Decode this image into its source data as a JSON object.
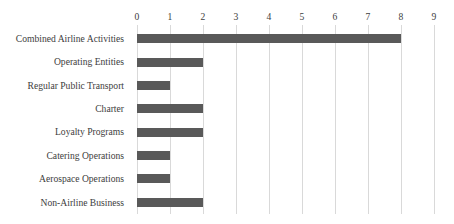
{
  "chart_data": {
    "type": "bar",
    "orientation": "horizontal",
    "title": "",
    "subtitle": "",
    "xlabel": "",
    "ylabel": "",
    "categories": [
      "Combined Airline Activities",
      "Operating Entities",
      "Regular Public Transport",
      "Charter",
      "Loyalty Programs",
      "Catering Operations",
      "Aerospace Operations",
      "Non-Airline Business"
    ],
    "values": [
      8,
      2,
      1,
      2,
      2,
      1,
      1,
      2
    ],
    "series": [
      {
        "name": "Count",
        "values": [
          8,
          2,
          1,
          2,
          2,
          1,
          1,
          2
        ]
      }
    ],
    "xlim": [
      0,
      9
    ],
    "xticks": [
      0,
      1,
      2,
      3,
      4,
      5,
      6,
      7,
      8,
      9
    ],
    "xtick_labels": [
      "0",
      "1",
      "2",
      "3",
      "4",
      "5",
      "6",
      "7",
      "8",
      "9"
    ],
    "grid": "vertical",
    "legend": "none",
    "bar_color": "#595959",
    "gridline_color": "#d9d9d9",
    "background_color": "#ffffff",
    "text_color": "#3d3d3d"
  }
}
